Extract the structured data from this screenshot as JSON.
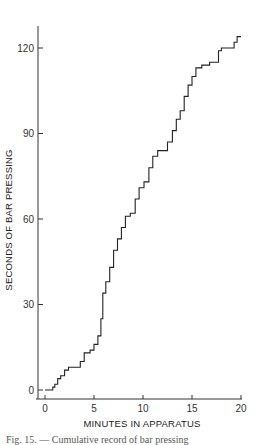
{
  "chart_data": {
    "type": "line",
    "step": true,
    "title": "",
    "xlabel": "MINUTES IN APPARATUS",
    "ylabel": "SECONDS OF BAR PRESSING",
    "xlim": [
      0,
      20
    ],
    "ylim": [
      0,
      125
    ],
    "xticks": [
      0,
      5,
      10,
      15,
      20
    ],
    "yticks": [
      0,
      30,
      60,
      90,
      120
    ],
    "grid": false,
    "legend": null,
    "series": [
      {
        "name": "Cumulative bar pressing",
        "x": [
          0,
          0.5,
          0.8,
          1.0,
          1.3,
          1.6,
          2.0,
          2.4,
          3.3,
          3.6,
          4.0,
          4.6,
          5.0,
          5.4,
          5.7,
          5.9,
          6.2,
          6.6,
          7.0,
          7.4,
          7.8,
          8.2,
          8.7,
          9.2,
          9.6,
          10.1,
          10.6,
          11.0,
          11.5,
          12.0,
          12.5,
          13.0,
          13.4,
          13.8,
          14.2,
          14.6,
          15.0,
          15.4,
          16.0,
          16.8,
          17.3,
          17.7,
          18.0,
          19.0,
          19.3,
          19.6,
          20.0
        ],
        "y": [
          0,
          0,
          1,
          2,
          4,
          5,
          7,
          8,
          8,
          10,
          13,
          14,
          16,
          19,
          25,
          34,
          38,
          43,
          49,
          53,
          57,
          61,
          62,
          67,
          71,
          73,
          78,
          82,
          84,
          84,
          87,
          91,
          95,
          98,
          103,
          107,
          110,
          113,
          114,
          115,
          115,
          119,
          120,
          120,
          122,
          124,
          124
        ]
      }
    ]
  },
  "labels": {
    "x_ticks": [
      "0",
      "5",
      "10",
      "15",
      "20"
    ],
    "y_ticks": [
      "0",
      "30",
      "60",
      "90",
      "120"
    ],
    "x_title": "MINUTES IN APPARATUS",
    "y_title": "SECONDS OF BAR PRESSING",
    "caption": "Fig. 15. — Cumulative record of bar pressing"
  },
  "colors": {
    "line": "#222222",
    "axis": "#333333",
    "background": "#ffffff"
  }
}
